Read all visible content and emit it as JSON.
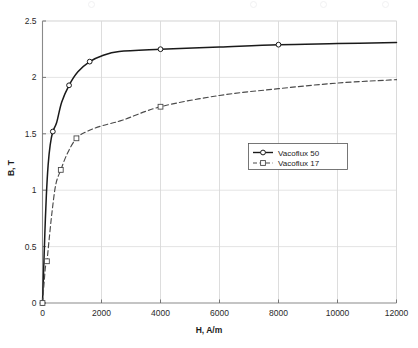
{
  "chart_data": {
    "type": "line",
    "title": "",
    "xlabel": "H, A/m",
    "ylabel": "B, T",
    "xlim": [
      0,
      12000
    ],
    "ylim": [
      0,
      2.5
    ],
    "xticks": [
      "0",
      "2000",
      "4000",
      "6000",
      "8000",
      "10000",
      "12000"
    ],
    "xtick_values": [
      0,
      2000,
      4000,
      6000,
      8000,
      10000,
      12000
    ],
    "yticks": [
      "0",
      "0.5",
      "1",
      "1.5",
      "2",
      "2.5"
    ],
    "ytick_values": [
      0,
      0.5,
      1,
      1.5,
      2,
      2.5
    ],
    "grid": true,
    "legend_position": "center",
    "series": [
      {
        "name": "Vacoflux 50",
        "style": "solid",
        "color": "#1a1a1a",
        "marker": "circle",
        "x": [
          0,
          40,
          80,
          130,
          190,
          260,
          350,
          480,
          650,
          900,
          1200,
          1600,
          2000,
          2600,
          4000,
          6000,
          8000,
          10000,
          12000
        ],
        "y": [
          0,
          0.3,
          0.62,
          0.95,
          1.22,
          1.4,
          1.52,
          1.6,
          1.78,
          1.93,
          2.05,
          2.14,
          2.19,
          2.23,
          2.25,
          2.27,
          2.29,
          2.3,
          2.31
        ],
        "markers_x": [
          0,
          350,
          900,
          1600,
          4000,
          8000
        ],
        "markers_y": [
          0,
          1.52,
          1.93,
          2.14,
          2.25,
          2.29
        ]
      },
      {
        "name": "Vacoflux 17",
        "style": "dashed",
        "color": "#4a4a4a",
        "marker": "square",
        "x": [
          0,
          30,
          60,
          100,
          150,
          220,
          320,
          450,
          620,
          850,
          1150,
          1500,
          2000,
          2700,
          4000,
          6000,
          8000,
          10000,
          12000
        ],
        "y": [
          0,
          0.1,
          0.2,
          0.32,
          0.37,
          0.55,
          0.8,
          1.05,
          1.18,
          1.33,
          1.46,
          1.52,
          1.57,
          1.62,
          1.74,
          1.84,
          1.9,
          1.95,
          1.98
        ],
        "markers_x": [
          0,
          150,
          620,
          1150,
          4000
        ],
        "markers_y": [
          0,
          0.37,
          1.18,
          1.46,
          1.74
        ]
      }
    ]
  },
  "legend": {
    "entries": [
      {
        "label": "Vacoflux 50",
        "marker": "circle",
        "style": "solid"
      },
      {
        "label": "Vacoflux 17",
        "marker": "square",
        "style": "dashed"
      }
    ]
  }
}
